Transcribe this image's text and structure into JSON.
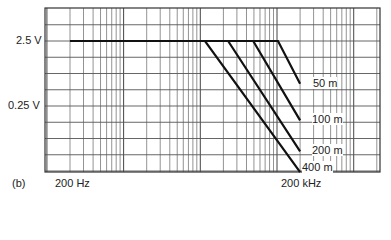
{
  "chart_data": {
    "type": "line",
    "panel_label": "(b)",
    "title": "",
    "xlabel": "",
    "ylabel": "",
    "x_scale": "log",
    "y_scale": "log",
    "xlim_hz": [
      120,
      1000000
    ],
    "ylim_v": [
      0.0085,
      4.2
    ],
    "x_tick_labels": [
      {
        "value": 200,
        "label": "200 Hz"
      },
      {
        "value": 200000,
        "label": "200 kHz"
      }
    ],
    "y_tick_labels": [
      {
        "value": 2.5,
        "label": "2.5 V"
      },
      {
        "value": 0.25,
        "label": "0.25 V"
      }
    ],
    "grid": true,
    "legend_position": "inline labels at line ends (right)",
    "series": [
      {
        "name": "400 m",
        "points": [
          [
            200,
            2.5
          ],
          [
            11500,
            2.5
          ],
          [
            200000,
            0.024
          ]
        ]
      },
      {
        "name": "200 m",
        "points": [
          [
            200,
            2.5
          ],
          [
            23000,
            2.5
          ],
          [
            200000,
            0.05
          ]
        ]
      },
      {
        "name": "100 m",
        "points": [
          [
            200,
            2.5
          ],
          [
            49000,
            2.5
          ],
          [
            200000,
            0.15
          ]
        ]
      },
      {
        "name": "50 m",
        "points": [
          [
            200,
            2.5
          ],
          [
            103000,
            2.5
          ],
          [
            200000,
            0.55
          ]
        ]
      }
    ]
  },
  "labels": {
    "panel": "(b)",
    "y_top": "2.5 V",
    "y_mid": "0.25 V",
    "x_left": "200 Hz",
    "x_right": "200 kHz",
    "s50": "50 m",
    "s100": "100 m",
    "s200": "200 m",
    "s400": "400 m"
  }
}
